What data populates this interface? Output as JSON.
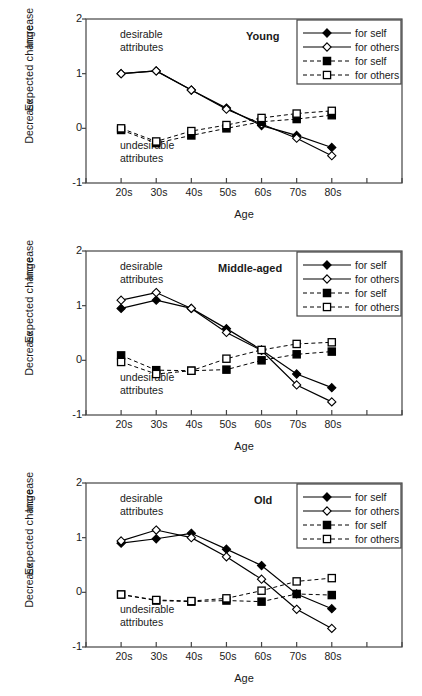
{
  "figure": {
    "axis": {
      "ylabel": "Expected change",
      "ylabel_increase": "Increase",
      "ylabel_decrease": "Decrease",
      "xlabel": "Age",
      "yticks": [
        "2",
        "1",
        "0",
        "-1"
      ],
      "xticks": [
        "20s",
        "30s",
        "40s",
        "50s",
        "60s",
        "70s",
        "80s"
      ]
    },
    "annotations": {
      "desirable_line1": "desirable",
      "desirable_line2": "attributes",
      "undesirable_line1": "undesirable",
      "undesirable_line2": "attributes"
    },
    "legend": {
      "entries": [
        {
          "label": "for self",
          "marker": "filled-diamond",
          "line": "solid"
        },
        {
          "label": "for others",
          "marker": "open-diamond",
          "line": "solid"
        },
        {
          "label": "for self",
          "marker": "filled-square",
          "line": "dashed"
        },
        {
          "label": "for others",
          "marker": "open-square",
          "line": "dashed"
        }
      ]
    },
    "panels": [
      {
        "title": "Young"
      },
      {
        "title": "Middle-aged"
      },
      {
        "title": "Old"
      }
    ]
  },
  "chart_data": [
    {
      "type": "line",
      "title": "Young",
      "xlabel": "Age",
      "ylabel": "Expected change",
      "categories": [
        "20s",
        "30s",
        "40s",
        "50s",
        "60s",
        "70s",
        "80s"
      ],
      "ylim": [
        -1,
        2
      ],
      "yticks": [
        -1,
        0,
        1,
        2
      ],
      "grid": false,
      "legend_position": "top-right",
      "series": [
        {
          "name": "desirable attributes - for self",
          "style": "solid-filled-diamond",
          "values": [
            1.0,
            1.05,
            0.7,
            0.37,
            0.05,
            -0.13,
            -0.35
          ]
        },
        {
          "name": "desirable attributes - for others",
          "style": "solid-open-diamond",
          "values": [
            1.0,
            1.05,
            0.7,
            0.35,
            0.08,
            -0.18,
            -0.5
          ]
        },
        {
          "name": "undesirable attributes - for self",
          "style": "dashed-filled-square",
          "values": [
            -0.03,
            -0.27,
            -0.13,
            0.0,
            0.12,
            0.17,
            0.24
          ]
        },
        {
          "name": "undesirable attributes - for others",
          "style": "dashed-open-square",
          "values": [
            0.0,
            -0.24,
            -0.05,
            0.06,
            0.19,
            0.27,
            0.32
          ]
        }
      ]
    },
    {
      "type": "line",
      "title": "Middle-aged",
      "xlabel": "Age",
      "ylabel": "Expected change",
      "categories": [
        "20s",
        "30s",
        "40s",
        "50s",
        "60s",
        "70s",
        "80s"
      ],
      "ylim": [
        -1,
        2
      ],
      "yticks": [
        -1,
        0,
        1,
        2
      ],
      "grid": false,
      "legend_position": "top-right",
      "series": [
        {
          "name": "desirable attributes - for self",
          "style": "solid-filled-diamond",
          "values": [
            0.95,
            1.1,
            0.95,
            0.58,
            0.19,
            -0.25,
            -0.5
          ]
        },
        {
          "name": "desirable attributes - for others",
          "style": "solid-open-diamond",
          "values": [
            1.1,
            1.24,
            0.95,
            0.51,
            0.18,
            -0.45,
            -0.76
          ]
        },
        {
          "name": "undesirable attributes - for self",
          "style": "dashed-filled-square",
          "values": [
            0.09,
            -0.18,
            -0.19,
            -0.17,
            0.0,
            0.11,
            0.16
          ]
        },
        {
          "name": "undesirable attributes - for others",
          "style": "dashed-open-square",
          "values": [
            -0.03,
            -0.25,
            -0.19,
            0.03,
            0.19,
            0.3,
            0.33
          ]
        }
      ]
    },
    {
      "type": "line",
      "title": "Old",
      "xlabel": "Age",
      "ylabel": "Expected change",
      "categories": [
        "20s",
        "30s",
        "40s",
        "50s",
        "60s",
        "70s",
        "80s"
      ],
      "ylim": [
        -1,
        2
      ],
      "yticks": [
        -1,
        0,
        1,
        2
      ],
      "grid": false,
      "legend_position": "top-right",
      "series": [
        {
          "name": "desirable attributes - for self",
          "style": "solid-filled-diamond",
          "values": [
            0.9,
            0.98,
            1.08,
            0.79,
            0.49,
            -0.03,
            -0.3
          ]
        },
        {
          "name": "desirable attributes - for others",
          "style": "solid-open-diamond",
          "values": [
            0.94,
            1.14,
            1.0,
            0.65,
            0.24,
            -0.31,
            -0.66
          ]
        },
        {
          "name": "undesirable attributes - for self",
          "style": "dashed-filled-square",
          "values": [
            -0.04,
            -0.15,
            -0.17,
            -0.15,
            -0.17,
            -0.03,
            -0.05
          ]
        },
        {
          "name": "undesirable attributes - for others",
          "style": "dashed-open-square",
          "values": [
            -0.04,
            -0.14,
            -0.16,
            -0.11,
            0.03,
            0.2,
            0.26
          ]
        }
      ]
    }
  ]
}
